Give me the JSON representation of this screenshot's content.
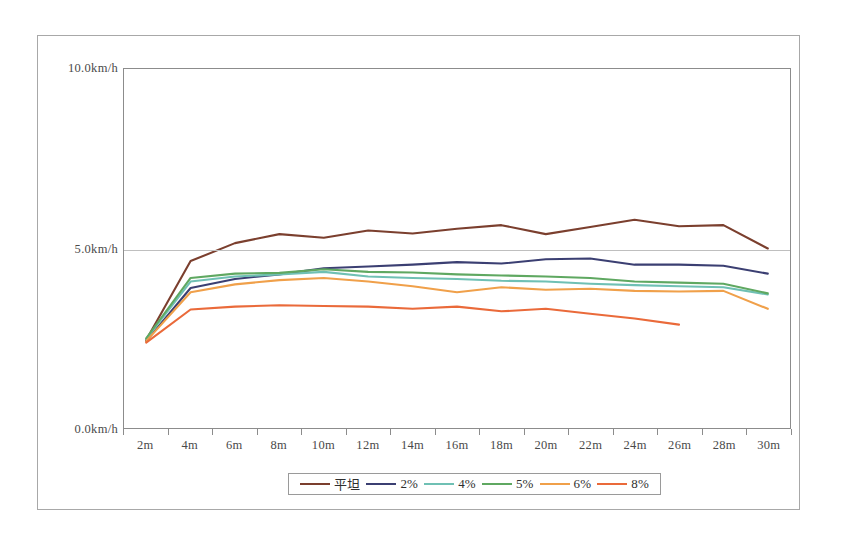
{
  "chart_data": {
    "type": "line",
    "title": "",
    "xlabel": "",
    "ylabel": "",
    "grid": true,
    "legend_position": "bottom",
    "categories": [
      "2m",
      "4m",
      "6m",
      "8m",
      "10m",
      "12m",
      "14m",
      "16m",
      "18m",
      "20m",
      "22m",
      "24m",
      "26m",
      "28m",
      "30m"
    ],
    "ylim": [
      0,
      10
    ],
    "y_ticks": [
      {
        "value": 10,
        "label": "10.0km/h"
      },
      {
        "value": 5,
        "label": "5.0km/h"
      },
      {
        "value": 0,
        "label": "0.0km/h"
      }
    ],
    "units": "km/h",
    "series": [
      {
        "name": "平坦",
        "color": "#7B3F2E",
        "values": [
          2.45,
          4.65,
          5.15,
          5.4,
          5.3,
          5.5,
          5.42,
          5.55,
          5.65,
          5.4,
          5.6,
          5.8,
          5.62,
          5.65,
          5.0
        ]
      },
      {
        "name": "2%",
        "color": "#3B3F72",
        "values": [
          2.42,
          3.9,
          4.15,
          4.28,
          4.45,
          4.5,
          4.55,
          4.62,
          4.58,
          4.7,
          4.72,
          4.55,
          4.55,
          4.52,
          4.3
        ]
      },
      {
        "name": "4%",
        "color": "#6FC0B4",
        "values": [
          2.48,
          4.08,
          4.22,
          4.28,
          4.35,
          4.22,
          4.18,
          4.15,
          4.1,
          4.08,
          4.02,
          3.98,
          3.95,
          3.92,
          3.72
        ]
      },
      {
        "name": "5%",
        "color": "#5FA861",
        "values": [
          2.5,
          4.18,
          4.3,
          4.32,
          4.42,
          4.35,
          4.33,
          4.28,
          4.25,
          4.22,
          4.18,
          4.08,
          4.05,
          4.02,
          3.75
        ]
      },
      {
        "name": "6%",
        "color": "#F0A04A",
        "values": [
          2.42,
          3.78,
          4.0,
          4.12,
          4.18,
          4.08,
          3.95,
          3.78,
          3.92,
          3.85,
          3.88,
          3.82,
          3.8,
          3.82,
          3.32
        ]
      },
      {
        "name": "8%",
        "color": "#EA6A3A",
        "values": [
          2.38,
          3.3,
          3.38,
          3.42,
          3.4,
          3.38,
          3.32,
          3.38,
          3.25,
          3.32,
          3.18,
          3.05,
          2.88,
          null,
          null
        ]
      }
    ]
  },
  "legend": {
    "items": [
      {
        "label": "平坦",
        "color": "#7B3F2E"
      },
      {
        "label": "2%",
        "color": "#3B3F72"
      },
      {
        "label": "4%",
        "color": "#6FC0B4"
      },
      {
        "label": "5%",
        "color": "#5FA861"
      },
      {
        "label": "6%",
        "color": "#F0A04A"
      },
      {
        "label": "8%",
        "color": "#EA6A3A"
      }
    ]
  },
  "colors": {
    "frame_border": "#a8a8a8",
    "axis": "#8c8c8c",
    "gridline": "#bfbfbf",
    "text": "#4a4a4a",
    "background": "#ffffff"
  }
}
